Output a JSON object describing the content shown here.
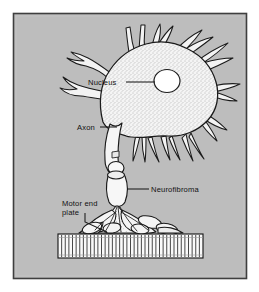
{
  "figure": {
    "panel": {
      "background_color": "#bdbdbd",
      "border_color": "#4a4a4a",
      "outer_background": "#ffffff"
    },
    "ink_color": "#1a1a1a",
    "cell_fill": "#f2f2f2",
    "nucleus_fill": "#ffffff"
  },
  "labels": [
    {
      "id": "nucleus",
      "text": "Nucleus",
      "lines": [
        "Nucleus"
      ],
      "text_x": 88,
      "text_y": 85,
      "leader": "M126,82 L155,82"
    },
    {
      "id": "axon",
      "text": "Axon",
      "lines": [
        "Axon"
      ],
      "text_x": 77,
      "text_y": 130,
      "leader": "M100,127 L118,127"
    },
    {
      "id": "neurofibroma",
      "text": "Neurofibroma",
      "lines": [
        "Neurofibroma"
      ],
      "text_x": 151,
      "text_y": 192,
      "leader": "M133,189 L149,189"
    },
    {
      "id": "motor-end-plate",
      "text": "Motor end plate",
      "lines": [
        "Motor end",
        "plate"
      ],
      "text_x": 62,
      "text_y": 206,
      "line_height": 9,
      "leader": "M84,212 L84,221 L108,231"
    }
  ],
  "structures": [
    {
      "id": "soma",
      "name": "cell body"
    },
    {
      "id": "nucleus",
      "name": "nucleus"
    },
    {
      "id": "dendrites",
      "name": "dendrites"
    },
    {
      "id": "axon",
      "name": "axon"
    },
    {
      "id": "neurofibroma",
      "name": "neurofibroma segments"
    },
    {
      "id": "end-plate",
      "name": "motor end plate terminals"
    },
    {
      "id": "muscle",
      "name": "striated muscle fiber"
    }
  ],
  "muscle": {
    "x_start": 58,
    "x_end": 203,
    "y_top": 234,
    "y_bottom": 258,
    "striation_count": 40
  }
}
